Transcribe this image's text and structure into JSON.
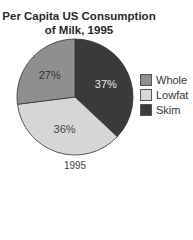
{
  "chart_data": {
    "type": "pie",
    "title": "Per Capita US Consumption of Milk, 1995",
    "title_lines": [
      "Per Capita US Consumption",
      "of Milk, 1995"
    ],
    "xlabel": "1995",
    "categories": [
      "Whole",
      "Lowfat",
      "Skim"
    ],
    "values": [
      27,
      36,
      37
    ],
    "labels": [
      "27%",
      "36%",
      "37%"
    ],
    "colors": [
      "#8f8f8f",
      "#d6d6d6",
      "#3a3a3a"
    ],
    "legend_position": "right"
  }
}
